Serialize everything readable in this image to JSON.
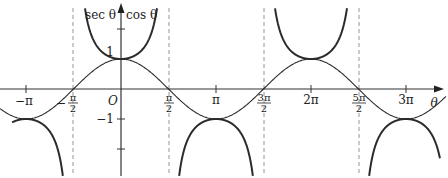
{
  "figure": {
    "y_axis_label_left": "sec θ",
    "y_axis_label_right": "cos θ",
    "x_axis_label": "θ",
    "origin_label": "O",
    "y_ticks": [
      {
        "value": 1,
        "label": "1"
      },
      {
        "value": -1,
        "label": "−1"
      },
      {
        "value": 2,
        "label": ""
      },
      {
        "value": -2,
        "label": ""
      }
    ],
    "x_ticks": [
      {
        "value": "-π",
        "label": "−π"
      },
      {
        "value": "-π/2",
        "label_sign": "−",
        "label_num": "π",
        "label_den": "2"
      },
      {
        "value": "π/2",
        "label_num": "π",
        "label_den": "2"
      },
      {
        "value": "π",
        "label": "π"
      },
      {
        "value": "3π/2",
        "label_num": "3π",
        "label_den": "2"
      },
      {
        "value": "2π",
        "label": "2π"
      },
      {
        "value": "5π/2",
        "label_num": "5π",
        "label_den": "2"
      },
      {
        "value": "3π",
        "label": "3π"
      }
    ],
    "curves": [
      {
        "name": "cos θ",
        "style": "thin"
      },
      {
        "name": "sec θ",
        "style": "thick"
      }
    ],
    "asymptotes": [
      "-π/2",
      "π/2",
      "3π/2",
      "5π/2"
    ]
  },
  "chart_data": {
    "type": "line",
    "title": "",
    "xlabel": "θ",
    "ylabel": "sec θ, cos θ",
    "xlim": [
      -3.4,
      10.4
    ],
    "ylim": [
      -2.7,
      2.8
    ],
    "x_tick_labels": [
      "−π",
      "−π/2",
      "π/2",
      "π",
      "3π/2",
      "2π",
      "5π/2",
      "3π"
    ],
    "y_tick_labels": [
      "1",
      "−1"
    ],
    "grid": false,
    "legend": "none (curves labelled at top of y-axis)",
    "series": [
      {
        "name": "cos θ",
        "x": [
          -3.4,
          -3.1416,
          -1.5708,
          0,
          1.5708,
          3.1416,
          4.7124,
          6.2832,
          7.854,
          9.4248,
          10.4
        ],
        "y": [
          -0.97,
          -1,
          0,
          1,
          0,
          -1,
          0,
          1,
          0,
          -1,
          -0.52
        ]
      },
      {
        "name": "sec θ",
        "x": [
          -3.4,
          -3.1416,
          -2.0,
          -1.9,
          0,
          1.18,
          1.9,
          3.1416,
          4.4,
          5.1,
          6.2832,
          7.46,
          8.2,
          9.4248,
          10.4
        ],
        "y": [
          -1.03,
          -1,
          -2.4,
          -3.1,
          1,
          2.6,
          -3.1,
          -1,
          -3.1,
          2.6,
          1,
          2.6,
          -3.1,
          -1,
          -1.9
        ]
      }
    ],
    "vertical_asymptotes": [
      -1.5708,
      1.5708,
      4.7124,
      7.854
    ]
  }
}
